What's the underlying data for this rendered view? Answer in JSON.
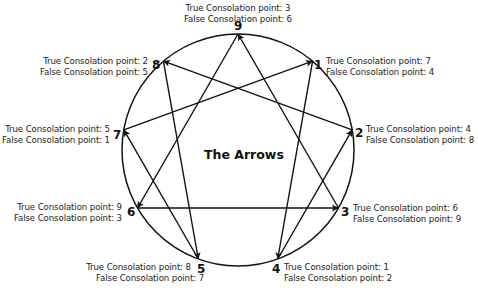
{
  "title": "The Arrows",
  "diagram": {
    "center": [
      238,
      150
    ],
    "radius": 116,
    "stroke_color": "#111111"
  },
  "points": [
    {
      "id": "9",
      "number": "9",
      "angle": 0,
      "true_label": "True Consolation point: 3",
      "false_label": "False Consolation point: 6"
    },
    {
      "id": "1",
      "number": "1",
      "angle": 40,
      "true_label": "True Consolation point: 7",
      "false_label": "False Consolation point: 4"
    },
    {
      "id": "2",
      "number": "2",
      "angle": 80,
      "true_label": "True Consolation point: 4",
      "false_label": "False Consolation point: 8"
    },
    {
      "id": "3",
      "number": "3",
      "angle": 120,
      "true_label": "True Consolation point: 6",
      "false_label": "False Consolation point: 9"
    },
    {
      "id": "4",
      "number": "4",
      "angle": 160,
      "true_label": "True Consolation point: 1",
      "false_label": "False Consolation point: 2"
    },
    {
      "id": "5",
      "number": "5",
      "angle": 200,
      "true_label": "True Consolation point: 8",
      "false_label": "False Consolation point: 7"
    },
    {
      "id": "6",
      "number": "6",
      "angle": 240,
      "true_label": "True Consolation point: 9",
      "false_label": "False Consolation point: 3"
    },
    {
      "id": "7",
      "number": "7",
      "angle": 280,
      "true_label": "True Consolation point: 5",
      "false_label": "False Consolation point: 1"
    },
    {
      "id": "8",
      "number": "8",
      "angle": 320,
      "true_label": "True Consolation point: 2",
      "false_label": "False Consolation point: 5"
    }
  ],
  "arrows": [
    {
      "from": "1",
      "to": "4"
    },
    {
      "from": "4",
      "to": "2"
    },
    {
      "from": "2",
      "to": "8"
    },
    {
      "from": "8",
      "to": "5"
    },
    {
      "from": "5",
      "to": "7"
    },
    {
      "from": "7",
      "to": "1"
    },
    {
      "from": "9",
      "to": "6"
    },
    {
      "from": "6",
      "to": "3"
    },
    {
      "from": "3",
      "to": "9"
    }
  ]
}
